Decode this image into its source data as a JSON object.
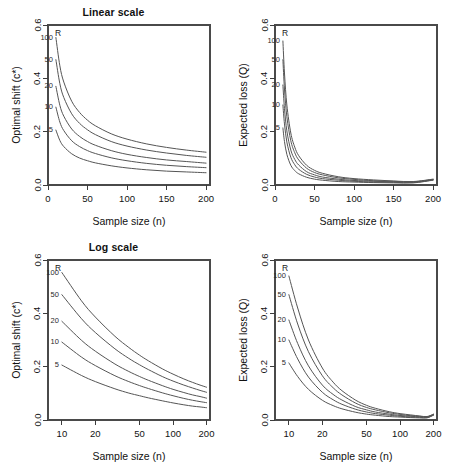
{
  "figure": {
    "width": 454,
    "height": 470,
    "background": "#ffffff",
    "curve_color": "#555555",
    "axis_color": "#3c3c3c",
    "legend_title": "R",
    "series_levels": [
      100,
      50,
      20,
      10,
      5
    ],
    "series_labels": [
      "100",
      "50",
      "20",
      "10",
      "5"
    ]
  },
  "titles": {
    "top_row": "Linear scale",
    "bottom_row": "Log scale"
  },
  "axis_titles": {
    "x": "Sample size  (n)",
    "y_shift": "Optimal shift  (c*)",
    "y_loss": "Expected loss  (Q)"
  },
  "chart_data": [
    {
      "id": "linear-optimal-shift",
      "type": "line",
      "title": "Linear scale",
      "xlabel": "Sample size  (n)",
      "ylabel": "Optimal shift  (c*)",
      "xscale": "linear",
      "yscale": "linear",
      "xlim": [
        0,
        205
      ],
      "ylim": [
        0.0,
        0.6
      ],
      "xticks": [
        0,
        50,
        100,
        150,
        200
      ],
      "xticklabels": [
        "0",
        "50",
        "100",
        "150",
        "200"
      ],
      "yticks": [
        0.0,
        0.2,
        0.4,
        0.6
      ],
      "yticklabels": [
        "0.0",
        "0.2",
        "0.4",
        "0.6"
      ],
      "grid": false,
      "legend": "inline curve labels at left, headed by R",
      "x": [
        10,
        15,
        20,
        30,
        40,
        50,
        60,
        80,
        100,
        125,
        150,
        175,
        200
      ],
      "series": [
        {
          "name": "100",
          "values": [
            0.553,
            0.447,
            0.386,
            0.314,
            0.272,
            0.243,
            0.222,
            0.192,
            0.172,
            0.154,
            0.141,
            0.131,
            0.123
          ]
        },
        {
          "name": "50",
          "values": [
            0.47,
            0.38,
            0.328,
            0.267,
            0.231,
            0.207,
            0.189,
            0.163,
            0.146,
            0.131,
            0.12,
            0.111,
            0.104
          ]
        },
        {
          "name": "20",
          "values": [
            0.37,
            0.299,
            0.258,
            0.21,
            0.182,
            0.163,
            0.149,
            0.129,
            0.115,
            0.103,
            0.094,
            0.088,
            0.082
          ]
        },
        {
          "name": "10",
          "values": [
            0.292,
            0.236,
            0.204,
            0.166,
            0.144,
            0.129,
            0.118,
            0.102,
            0.091,
            0.081,
            0.074,
            0.069,
            0.065
          ]
        },
        {
          "name": "5",
          "values": [
            0.206,
            0.167,
            0.144,
            0.117,
            0.101,
            0.091,
            0.083,
            0.072,
            0.064,
            0.057,
            0.052,
            0.049,
            0.046
          ]
        }
      ]
    },
    {
      "id": "linear-expected-loss",
      "type": "line",
      "title": "Linear scale",
      "xlabel": "Sample size  (n)",
      "ylabel": "Expected loss  (Q)",
      "xscale": "linear",
      "yscale": "linear",
      "xlim": [
        0,
        205
      ],
      "ylim": [
        0.0,
        0.6
      ],
      "xticks": [
        0,
        50,
        100,
        150,
        200
      ],
      "xticklabels": [
        "0",
        "50",
        "100",
        "150",
        "200"
      ],
      "yticks": [
        0.0,
        0.2,
        0.4,
        0.6
      ],
      "yticklabels": [
        "0.0",
        "0.2",
        "0.4",
        "0.6"
      ],
      "grid": false,
      "legend": "inline curve labels at left, headed by R",
      "x": [
        10,
        12,
        15,
        20,
        25,
        30,
        40,
        50,
        60,
        80,
        100,
        125,
        150,
        175,
        200
      ],
      "series": [
        {
          "name": "100",
          "values": [
            0.54,
            0.42,
            0.3,
            0.195,
            0.142,
            0.11,
            0.074,
            0.055,
            0.044,
            0.031,
            0.024,
            0.019,
            0.015,
            0.013,
            0.022
          ]
        },
        {
          "name": "50",
          "values": [
            0.47,
            0.36,
            0.256,
            0.166,
            0.121,
            0.094,
            0.063,
            0.047,
            0.038,
            0.027,
            0.021,
            0.016,
            0.014,
            0.012,
            0.021
          ]
        },
        {
          "name": "20",
          "values": [
            0.375,
            0.287,
            0.203,
            0.131,
            0.096,
            0.075,
            0.05,
            0.038,
            0.03,
            0.022,
            0.017,
            0.014,
            0.012,
            0.011,
            0.02
          ]
        },
        {
          "name": "10",
          "values": [
            0.3,
            0.229,
            0.161,
            0.104,
            0.076,
            0.059,
            0.04,
            0.03,
            0.024,
            0.018,
            0.014,
            0.011,
            0.01,
            0.009,
            0.019
          ]
        },
        {
          "name": "5",
          "values": [
            0.214,
            0.163,
            0.115,
            0.074,
            0.054,
            0.042,
            0.029,
            0.022,
            0.018,
            0.013,
            0.011,
            0.009,
            0.008,
            0.008,
            0.018
          ]
        }
      ]
    },
    {
      "id": "log-optimal-shift",
      "type": "line",
      "title": "Log scale",
      "xlabel": "Sample size  (n)",
      "ylabel": "Optimal shift  (c*)",
      "xscale": "log",
      "yscale": "linear",
      "xlim": [
        7.5,
        215
      ],
      "ylim": [
        0.0,
        0.6
      ],
      "xticks": [
        10,
        20,
        50,
        100,
        200
      ],
      "xticklabels": [
        "10",
        "20",
        "50",
        "100",
        "200"
      ],
      "yticks": [
        0.0,
        0.2,
        0.4,
        0.6
      ],
      "yticklabels": [
        "0.0",
        "0.2",
        "0.4",
        "0.6"
      ],
      "grid": false,
      "legend": "inline curve labels at left, headed by R",
      "x": [
        10,
        15,
        20,
        30,
        40,
        50,
        60,
        80,
        100,
        125,
        150,
        175,
        200
      ],
      "series": [
        {
          "name": "100",
          "values": [
            0.553,
            0.447,
            0.386,
            0.314,
            0.272,
            0.243,
            0.222,
            0.192,
            0.172,
            0.154,
            0.141,
            0.131,
            0.123
          ]
        },
        {
          "name": "50",
          "values": [
            0.47,
            0.38,
            0.328,
            0.267,
            0.231,
            0.207,
            0.189,
            0.163,
            0.146,
            0.131,
            0.12,
            0.111,
            0.104
          ]
        },
        {
          "name": "20",
          "values": [
            0.37,
            0.299,
            0.258,
            0.21,
            0.182,
            0.163,
            0.149,
            0.129,
            0.115,
            0.103,
            0.094,
            0.088,
            0.082
          ]
        },
        {
          "name": "10",
          "values": [
            0.292,
            0.236,
            0.204,
            0.166,
            0.144,
            0.129,
            0.118,
            0.102,
            0.091,
            0.081,
            0.074,
            0.069,
            0.065
          ]
        },
        {
          "name": "5",
          "values": [
            0.206,
            0.167,
            0.144,
            0.117,
            0.101,
            0.091,
            0.083,
            0.072,
            0.064,
            0.057,
            0.052,
            0.049,
            0.046
          ]
        }
      ]
    },
    {
      "id": "log-expected-loss",
      "type": "line",
      "title": "Log scale",
      "xlabel": "Sample size  (n)",
      "ylabel": "Expected loss  (Q)",
      "xscale": "log",
      "yscale": "linear",
      "xlim": [
        7.5,
        215
      ],
      "ylim": [
        0.0,
        0.6
      ],
      "xticks": [
        10,
        20,
        50,
        100,
        200
      ],
      "xticklabels": [
        "10",
        "20",
        "50",
        "100",
        "200"
      ],
      "yticks": [
        0.0,
        0.2,
        0.4,
        0.6
      ],
      "yticklabels": [
        "0.0",
        "0.2",
        "0.4",
        "0.6"
      ],
      "grid": false,
      "legend": "inline curve labels at left, headed by R",
      "x": [
        10,
        12,
        15,
        20,
        25,
        30,
        40,
        50,
        60,
        80,
        100,
        125,
        150,
        175,
        200
      ],
      "series": [
        {
          "name": "100",
          "values": [
            0.54,
            0.42,
            0.3,
            0.195,
            0.142,
            0.11,
            0.074,
            0.055,
            0.044,
            0.031,
            0.024,
            0.019,
            0.015,
            0.013,
            0.022
          ]
        },
        {
          "name": "50",
          "values": [
            0.47,
            0.36,
            0.256,
            0.166,
            0.121,
            0.094,
            0.063,
            0.047,
            0.038,
            0.027,
            0.021,
            0.016,
            0.014,
            0.012,
            0.021
          ]
        },
        {
          "name": "20",
          "values": [
            0.375,
            0.287,
            0.203,
            0.131,
            0.096,
            0.075,
            0.05,
            0.038,
            0.03,
            0.022,
            0.017,
            0.014,
            0.012,
            0.011,
            0.02
          ]
        },
        {
          "name": "10",
          "values": [
            0.3,
            0.229,
            0.161,
            0.104,
            0.076,
            0.059,
            0.04,
            0.03,
            0.024,
            0.018,
            0.014,
            0.011,
            0.01,
            0.009,
            0.019
          ]
        },
        {
          "name": "5",
          "values": [
            0.214,
            0.163,
            0.115,
            0.074,
            0.054,
            0.042,
            0.029,
            0.022,
            0.018,
            0.013,
            0.011,
            0.009,
            0.008,
            0.008,
            0.018
          ]
        }
      ]
    }
  ]
}
